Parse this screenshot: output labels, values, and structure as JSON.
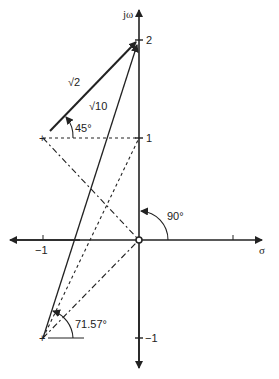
{
  "diagram": {
    "type": "s-plane vector diagram",
    "axes": {
      "vertical_label": "jω",
      "horizontal_label": "σ",
      "ticks": {
        "y_pos2": "2",
        "y_pos1": "1",
        "y_neg1": "−1",
        "x_neg1": "−1"
      }
    },
    "points": {
      "zero": {
        "label": "origin zero",
        "s": [
          0,
          0
        ]
      },
      "pole_upper": {
        "s": [
          -1,
          1
        ]
      },
      "pole_lower": {
        "s": [
          -1,
          -1
        ]
      },
      "test_point": {
        "s": [
          0,
          2
        ]
      }
    },
    "vectors": [
      {
        "from": [
          -1,
          1
        ],
        "to": [
          0,
          2
        ],
        "magnitude_label": "√2",
        "angle_label": "45°"
      },
      {
        "from": [
          -1,
          -1
        ],
        "to": [
          0,
          2
        ],
        "magnitude_label": "√10",
        "angle_label": "71.57°"
      },
      {
        "from": [
          0,
          0
        ],
        "to": [
          0,
          2
        ],
        "angle_label": "90°"
      }
    ],
    "labels": {
      "sqrt2": "√2",
      "sqrt10": "√10",
      "angle45": "45°",
      "angle90": "90°",
      "angle7157": "71.57°"
    }
  }
}
